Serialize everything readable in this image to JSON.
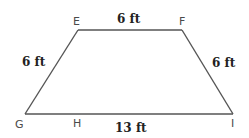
{
  "diagram": {
    "type": "trapezoid",
    "colors": {
      "stroke": "#555555",
      "vertex_label": "#4a4a4a",
      "measure_label": "#222222",
      "background": "#ffffff"
    },
    "vertices": {
      "E": {
        "label": "E",
        "x": 78,
        "y": 30
      },
      "F": {
        "label": "F",
        "x": 182,
        "y": 30
      },
      "G": {
        "label": "G",
        "x": 25,
        "y": 114
      },
      "H": {
        "label": "H",
        "x": 77,
        "y": 114
      },
      "I": {
        "label": "I",
        "x": 233,
        "y": 114
      }
    },
    "measurements": {
      "top_EF": "6 ft",
      "left_EG": "6 ft",
      "right_FI": "6 ft",
      "bottom_GI": "13 ft"
    }
  }
}
